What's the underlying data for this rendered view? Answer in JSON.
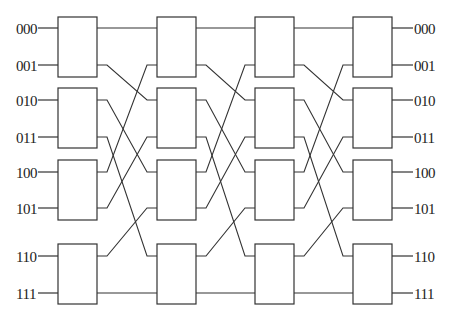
{
  "diagram": {
    "type": "omega-shuffle-exchange-network",
    "stages": 4,
    "switches_per_stage": 4,
    "input_labels": [
      "000",
      "001",
      "010",
      "011",
      "100",
      "101",
      "110",
      "111"
    ],
    "output_labels": [
      "000",
      "001",
      "010",
      "011",
      "100",
      "101",
      "110",
      "111"
    ],
    "columns_x": [
      58,
      157,
      255,
      353
    ],
    "box_width": 39,
    "box_rows": [
      [
        17,
        77
      ],
      [
        88,
        148
      ],
      [
        160,
        220
      ],
      [
        244,
        304
      ]
    ],
    "port_y": [
      28,
      65,
      100,
      137,
      172,
      208,
      256,
      293
    ],
    "shuffle_map": [
      0,
      2,
      4,
      6,
      1,
      3,
      5,
      7
    ],
    "line_color": "#333333",
    "text_color": "#222222"
  }
}
